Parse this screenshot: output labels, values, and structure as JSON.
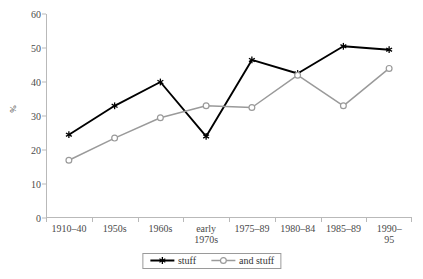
{
  "chart_data": {
    "type": "line",
    "title": "",
    "subtitle": "",
    "xlabel": "",
    "ylabel": "%",
    "ylim": [
      0,
      60
    ],
    "yticks": [
      0,
      10,
      20,
      30,
      40,
      50,
      60
    ],
    "grid": false,
    "legend_position": "bottom",
    "categories": [
      "1910–40",
      "1950s",
      "1960s",
      "early\n1970s",
      "1975–89",
      "1980–84",
      "1985–89",
      "1990–95"
    ],
    "series": [
      {
        "name": "stuff",
        "color": "#000000",
        "marker": "asterisk",
        "values": [
          24.5,
          33.0,
          40.0,
          24.0,
          46.5,
          42.5,
          50.5,
          49.5
        ]
      },
      {
        "name": "and stuff",
        "color": "#9a9a9a",
        "marker": "circle-open",
        "values": [
          17.0,
          23.5,
          29.5,
          33.0,
          32.5,
          42.0,
          33.0,
          44.0
        ]
      }
    ]
  },
  "axes": {
    "y_title": "%",
    "y_tick_labels": [
      "0",
      "10",
      "20",
      "30",
      "40",
      "50",
      "60"
    ],
    "x_tick_labels": [
      "1910–40",
      "1950s",
      "1960s",
      "early\n1970s",
      "1975–89",
      "1980–84",
      "1985–89",
      "1990–95"
    ]
  },
  "legend": {
    "entries": [
      {
        "label": "stuff",
        "color": "#000000",
        "marker": "asterisk"
      },
      {
        "label": "and stuff",
        "color": "#9a9a9a",
        "marker": "circle-open"
      }
    ]
  },
  "caption": {
    "text": ""
  },
  "colors": {
    "series_primary": "#000000",
    "series_secondary": "#9a9a9a",
    "axis": "#b9b9b9",
    "text": "#4a4a4a",
    "background": "#ffffff"
  }
}
